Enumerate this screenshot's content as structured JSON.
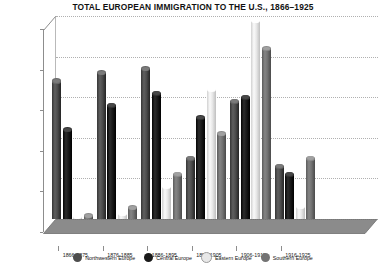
{
  "chart_data": {
    "type": "bar",
    "title": "TOTAL EUROPEAN IMMIGRATION TO THE U.S., 1866–1925",
    "xlabel": "",
    "ylabel": "",
    "ylim": [
      0,
      2500000
    ],
    "ytick_labels": [
      "2,500,000",
      "2,000,000",
      "1,500,000",
      "1,000,000",
      "500,000",
      "0"
    ],
    "ytick_values": [
      2500000,
      2000000,
      1500000,
      1000000,
      500000,
      0
    ],
    "grid": true,
    "legend_position": "bottom",
    "categories": [
      "1866-1875",
      "1876-1885",
      "1886-1895",
      "1896-1905",
      "1906-1915",
      "1916-1925"
    ],
    "series": [
      {
        "name": "Northwestern Europe",
        "color": "#4d4d4d",
        "values": [
          1700000,
          1800000,
          1850000,
          750000,
          1450000,
          650000
        ]
      },
      {
        "name": "Central Europe",
        "color": "#1a1a1a",
        "values": [
          1100000,
          1400000,
          1550000,
          1250000,
          1500000,
          550000
        ]
      },
      {
        "name": "Eastern Europe",
        "color": "#e8e8e8",
        "values": [
          35000,
          75000,
          400000,
          1600000,
          2450000,
          150000
        ]
      },
      {
        "name": "Southern Europe",
        "color": "#737373",
        "values": [
          40000,
          140000,
          550000,
          1050000,
          2100000,
          750000
        ]
      }
    ]
  },
  "legend": {
    "items": [
      {
        "label": "Northwestern Europe"
      },
      {
        "label": "Central Europe"
      },
      {
        "label": "Eastern Europe"
      },
      {
        "label": "Southern Europe"
      }
    ]
  }
}
